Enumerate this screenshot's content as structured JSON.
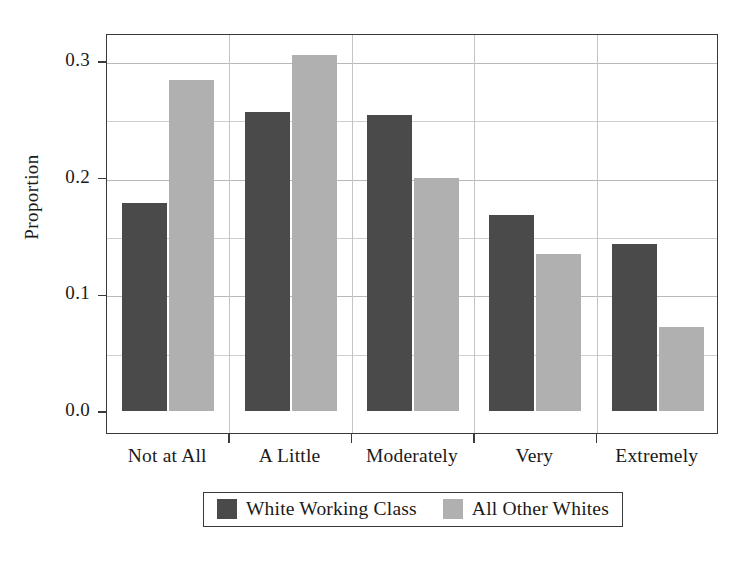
{
  "chart_data": {
    "type": "bar",
    "title": "",
    "subtitle": "",
    "xlabel": "",
    "ylabel": "Proportion",
    "categories": [
      "Not at All",
      "A Little",
      "Moderately",
      "Very",
      "Extremely"
    ],
    "series": [
      {
        "name": "White Working Class",
        "color": "#4a4a4a",
        "values": [
          0.178,
          0.256,
          0.254,
          0.168,
          0.143
        ]
      },
      {
        "name": "All Other Whites",
        "color": "#b0b0b0",
        "values": [
          0.284,
          0.305,
          0.2,
          0.135,
          0.072
        ]
      }
    ],
    "ylim": [
      0.0,
      0.325
    ],
    "ytick_values": [
      0.0,
      0.1,
      0.2,
      0.3
    ],
    "ytick_labels": [
      "0.0",
      "0.1",
      "0.2",
      "0.3"
    ],
    "yminor_gridlines": [
      0.05,
      0.15,
      0.25
    ],
    "grid": true,
    "grid_axis": "both",
    "legend_position": "bottom-outside",
    "legend_boxed": true,
    "bar_orientation": "vertical",
    "grouped": true
  },
  "axis": {
    "y_title": "Proportion"
  }
}
